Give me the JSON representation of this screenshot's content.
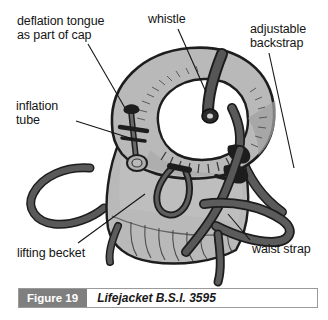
{
  "figure": {
    "caption_number": "Figure 19",
    "caption_text": "Lifejacket B.S.I. 3595"
  },
  "annotations": [
    {
      "id": "deflation-tongue",
      "text": "deflation tongue\nas part of cap",
      "line_from": [
        88,
        44
      ],
      "line_to": [
        125,
        108
      ]
    },
    {
      "id": "inflation-tube",
      "text": "inflation\ntube",
      "line_from": [
        76,
        121
      ],
      "line_to": [
        133,
        139
      ]
    },
    {
      "id": "whistle",
      "text": "whistle",
      "line_from": [
        178,
        29
      ],
      "line_to": [
        204,
        89
      ]
    },
    {
      "id": "adjustable-backstrap",
      "text": "adjustable\nbackstrap",
      "line_from": [
        269,
        53
      ],
      "line_to": [
        293,
        160
      ]
    },
    {
      "id": "lifting-becket",
      "text": "lifting becket",
      "line_from": [
        78,
        243
      ],
      "line_to": [
        143,
        197
      ]
    },
    {
      "id": "waist-strap",
      "text": "waist strap",
      "line_from": [
        252,
        240
      ],
      "line_to": [
        228,
        215
      ]
    }
  ],
  "colors": {
    "jacket_fill": "#b9b9b9",
    "jacket_fill_light": "#c6c6c6",
    "jacket_shadow": "#9b9b9b",
    "strap_dark": "#4a4a4a",
    "outline": "#1d1d1d",
    "caption_box": "#7f7f7f",
    "background": "#ffffff",
    "text": "#141414"
  }
}
